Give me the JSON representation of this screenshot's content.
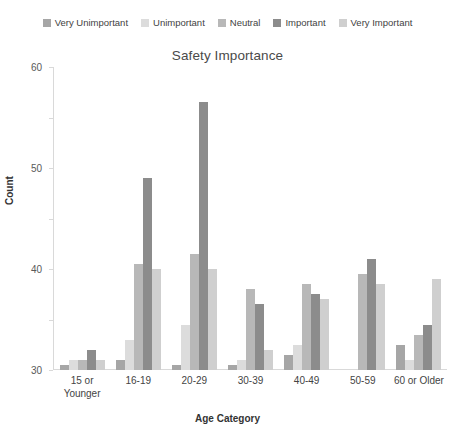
{
  "chart_data": {
    "type": "bar",
    "title": "Safety Importance",
    "xlabel": "Age Category",
    "ylabel": "Count",
    "ylim": [
      0,
      60
    ],
    "yticks": [
      0,
      10,
      20,
      30,
      40,
      50,
      60
    ],
    "grid": false,
    "legend_position": "top",
    "categories": [
      "15 or Younger",
      "16-19",
      "20-29",
      "30-39",
      "40-49",
      "50-59",
      "60 or Older"
    ],
    "category_lines": [
      [
        "15 or",
        "Younger"
      ],
      [
        "16-19"
      ],
      [
        "20-29"
      ],
      [
        "30-39"
      ],
      [
        "40-49"
      ],
      [
        "50-59"
      ],
      [
        "60 or Older"
      ]
    ],
    "series": [
      {
        "name": "Very Unimportant",
        "color": "#a6a6a6",
        "values": [
          1,
          2,
          1,
          1,
          3,
          0,
          5
        ]
      },
      {
        "name": "Unimportant",
        "color": "#dcdcdc",
        "values": [
          2,
          6,
          9,
          2,
          5,
          0,
          2
        ]
      },
      {
        "name": "Neutral",
        "color": "#b8b8b8",
        "values": [
          2,
          21,
          23,
          16,
          17,
          19,
          7
        ]
      },
      {
        "name": "Important",
        "color": "#8c8c8c",
        "values": [
          4,
          38,
          53,
          13,
          15,
          22,
          9
        ]
      },
      {
        "name": "Very Important",
        "color": "#cfcfcf",
        "values": [
          2,
          20,
          20,
          4,
          14,
          17,
          18
        ]
      }
    ]
  },
  "legend": {
    "items": [
      {
        "label": "Very Unimportant"
      },
      {
        "label": "Unimportant"
      },
      {
        "label": "Neutral"
      },
      {
        "label": "Important"
      },
      {
        "label": "Very Important"
      }
    ]
  }
}
